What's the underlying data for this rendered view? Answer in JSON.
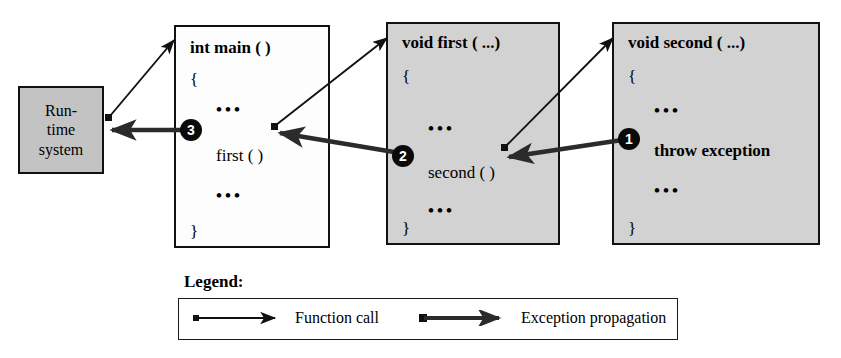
{
  "diagram": {
    "runtime": {
      "name": "runtime-system-box",
      "line1": "Run-",
      "line2": "time",
      "line3": "system",
      "fill": "#c3c3c3",
      "border": "#111111"
    },
    "boxes": [
      {
        "id": "main",
        "signature": "int main ( )",
        "open_brace": "{",
        "ellipsis_top": "•••",
        "statement": "first ( )",
        "statement_bold": false,
        "ellipsis_bottom": "•••",
        "close_brace": "}",
        "fill": "#fdfdfd",
        "border": "#111111",
        "marker": "3"
      },
      {
        "id": "first",
        "signature": "void first ( ...)",
        "open_brace": "{",
        "ellipsis_top": "•••",
        "statement": "second ( )",
        "statement_bold": false,
        "ellipsis_bottom": "•••",
        "close_brace": "}",
        "fill": "#d2d2d2",
        "border": "#111111",
        "marker": "2"
      },
      {
        "id": "second",
        "signature": "void second ( ...)",
        "open_brace": "{",
        "ellipsis_top": "•••",
        "statement": "throw exception",
        "statement_bold": true,
        "ellipsis_bottom": "•••",
        "close_brace": "}",
        "fill": "#d2d2d2",
        "border": "#111111",
        "marker": "1"
      }
    ],
    "arrows": [
      {
        "id": "call-runtime-to-main",
        "kind": "function-call"
      },
      {
        "id": "call-main-to-first",
        "kind": "function-call"
      },
      {
        "id": "call-first-to-second",
        "kind": "function-call"
      },
      {
        "id": "throw-second-to-first",
        "kind": "exception-propagation"
      },
      {
        "id": "throw-first-to-main",
        "kind": "exception-propagation"
      },
      {
        "id": "throw-main-to-runtime",
        "kind": "exception-propagation"
      }
    ]
  },
  "legend": {
    "title": "Legend:",
    "entries": [
      {
        "id": "function-call",
        "label": "Function call"
      },
      {
        "id": "exception-propagation",
        "label": "Exception propagation"
      }
    ]
  },
  "colors": {
    "ink": "#111111",
    "box_gray": "#d2d2d2",
    "runtime_gray": "#c3c3c3",
    "marker_fill": "#0a0a0a",
    "marker_text": "#ffffff"
  }
}
